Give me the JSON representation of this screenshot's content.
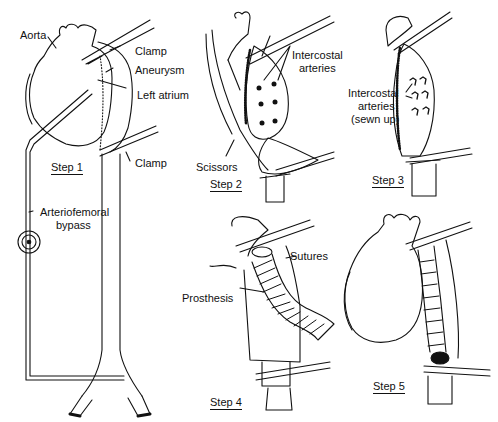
{
  "figure": {
    "step1": {
      "step_label": "Step 1",
      "labels": {
        "aorta": "Aorta",
        "clamp_top": "Clamp",
        "aneurysm": "Aneurysm",
        "left_atrium": "Left atrium",
        "clamp_bottom": "Clamp",
        "bypass_line1": "Arteriofemoral",
        "bypass_line2": "bypass"
      }
    },
    "step2": {
      "step_label": "Step 2",
      "labels": {
        "intercostal_line1": "Intercostal",
        "intercostal_line2": "arteries",
        "scissors": "Scissors"
      }
    },
    "step3": {
      "step_label": "Step 3",
      "labels": {
        "line1": "Intercostal",
        "line2": "arteries",
        "line3": "(sewn up)"
      }
    },
    "step4": {
      "step_label": "Step 4",
      "labels": {
        "sutures": "Sutures",
        "prosthesis": "Prosthesis"
      }
    },
    "step5": {
      "step_label": "Step 5"
    }
  },
  "colors": {
    "ink": "#111111",
    "background": "#ffffff"
  }
}
